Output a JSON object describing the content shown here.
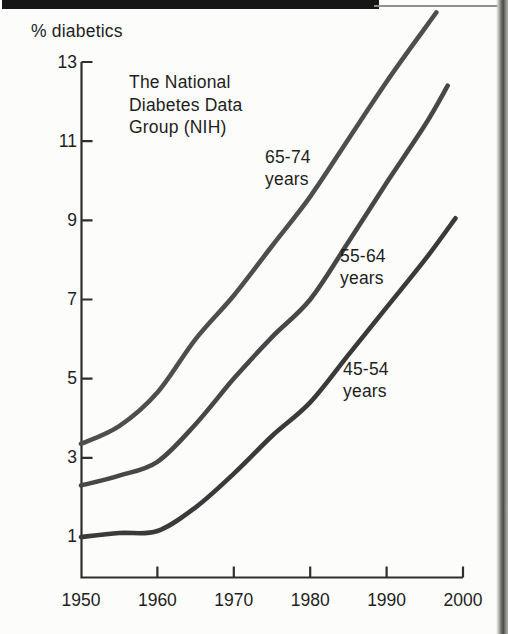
{
  "page": {
    "background": "#fcfcfa",
    "top_bar_color": "#161616",
    "page_edge_color": "#4d4d4a"
  },
  "chart_data": {
    "type": "line",
    "ylabel": "% diabetics",
    "annotation": "The National\nDiabetes Data\nGroup (NIH)",
    "xlim": [
      1950,
      2000
    ],
    "ylim": [
      0,
      14.5
    ],
    "x_ticks": [
      1950,
      1960,
      1970,
      1980,
      1990,
      2000
    ],
    "y_ticks": [
      1,
      3,
      5,
      7,
      9,
      11,
      13
    ],
    "grid": false,
    "legend": "inline-labels",
    "axis_color": "#2e2e2e",
    "series": [
      {
        "name": "65-74 years",
        "label_lines": [
          "65-74",
          "years"
        ],
        "color": "#4e4e4e",
        "x": [
          1950,
          1955,
          1960,
          1965,
          1970,
          1975,
          1980,
          1985,
          1990,
          1995,
          1996.5
        ],
        "values": [
          3.35,
          3.8,
          4.65,
          6.0,
          7.1,
          8.35,
          9.6,
          11.05,
          12.5,
          13.85,
          14.25
        ]
      },
      {
        "name": "55-64 years",
        "label_lines": [
          "55-64",
          "years"
        ],
        "color": "#474747",
        "x": [
          1950,
          1955,
          1960,
          1965,
          1970,
          1975,
          1980,
          1985,
          1990,
          1995,
          1998
        ],
        "values": [
          2.3,
          2.55,
          2.9,
          3.85,
          5.0,
          6.05,
          7.0,
          8.45,
          9.95,
          11.4,
          12.4
        ]
      },
      {
        "name": "45-54 years",
        "label_lines": [
          "45-54",
          "years"
        ],
        "color": "#3a3a3a",
        "x": [
          1950,
          1955,
          1960,
          1965,
          1970,
          1975,
          1980,
          1985,
          1990,
          1995,
          1999
        ],
        "values": [
          1.0,
          1.1,
          1.15,
          1.75,
          2.6,
          3.55,
          4.4,
          5.6,
          6.8,
          8.0,
          9.05
        ]
      }
    ]
  }
}
